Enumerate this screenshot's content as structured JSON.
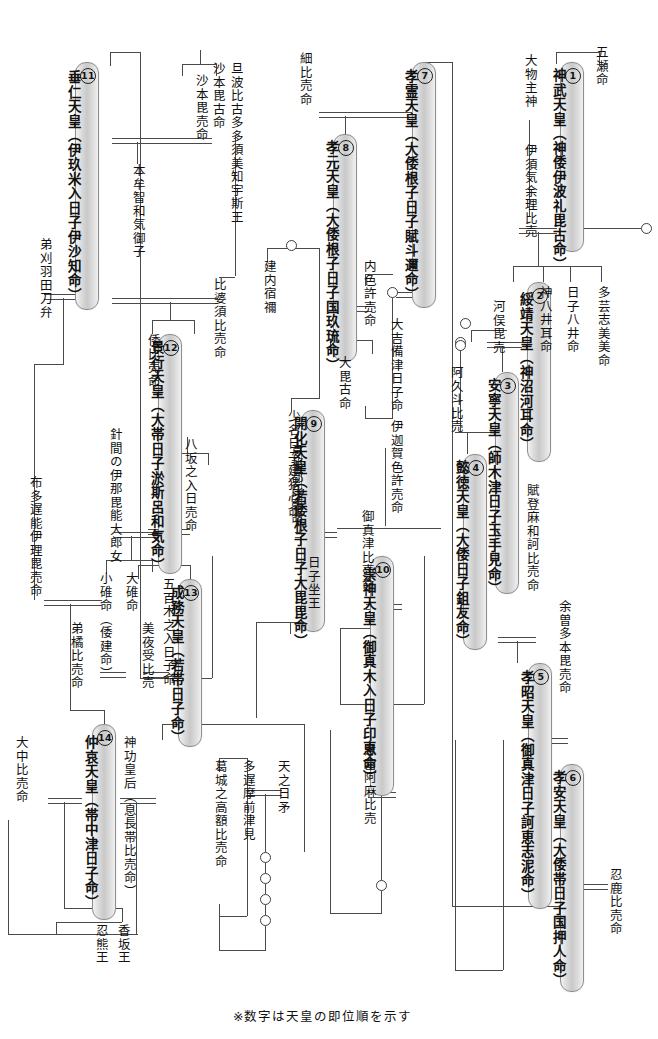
{
  "footnote": "※数字は天皇の即位順を示す",
  "emperors": [
    {
      "num": "①",
      "n": "1",
      "name": "神武天皇（神倭伊波礼毘古命）"
    },
    {
      "num": "②",
      "n": "2",
      "name": "綏靖天皇（神沼河耳命）"
    },
    {
      "num": "③",
      "n": "3",
      "name": "安寧天皇（師木津日子玉手見命）"
    },
    {
      "num": "④",
      "n": "4",
      "name": "懿徳天皇（大倭日子鉏友命）"
    },
    {
      "num": "⑤",
      "n": "5",
      "name": "孝昭天皇（御真津日子訶恵志泥命）"
    },
    {
      "num": "⑥",
      "n": "6",
      "name": "孝安天皇（大倭帯日子国押人命）"
    },
    {
      "num": "⑦",
      "n": "7",
      "name": "孝霊天皇（大倭根子日子賦斗邇命）"
    },
    {
      "num": "⑧",
      "n": "8",
      "name": "孝元天皇（大倭根子日子国玖琉命）"
    },
    {
      "num": "⑨",
      "n": "9",
      "name": "開化天皇（若倭根子日子大毘毘命）"
    },
    {
      "num": "⑩",
      "n": "10",
      "name": "崇神天皇（御真木入日子印恵命）"
    },
    {
      "num": "⑪",
      "n": "11",
      "name": "垂仁天皇（伊玖米入日子伊沙知命）"
    },
    {
      "num": "⑫",
      "n": "12",
      "name": "景行天皇（大帯日子淤斯呂和気命）"
    },
    {
      "num": "⑬",
      "n": "13",
      "name": "成務天皇（若帯日子命）"
    },
    {
      "num": "⑭",
      "n": "14",
      "name": "仲哀天皇（帯中津日子命）"
    }
  ],
  "names": [
    "五瀬命",
    "大物主神",
    "伊須気余理比売",
    "多芸志美美命",
    "日子八井命",
    "神八井耳命",
    "河俣毘売",
    "賦登麻和訶比売命",
    "余曽多本毘売命",
    "忍鹿比売命",
    "細比売命",
    "内色許売命",
    "大吉備津日子命",
    "阿久斗比売",
    "伊迦賀色許売命",
    "大毘古命",
    "建内宿禰",
    "少名日子建猪心命",
    "意祁都比売命",
    "日子坐王",
    "御真津比売命",
    "意富阿麻比売",
    "旦波比古多多須美知宇斯王",
    "沙本毘古命",
    "沙本毘売命",
    "比婆須比売命",
    "本牟智和気御子",
    "倭比売命",
    "弟刈羽田刀弁",
    "布多遅能伊理毘売命",
    "針間の伊那毘能大郎女",
    "八坂之入日売命",
    "五百木之入日子命",
    "大碓命",
    "小碓命（倭建命）",
    "美夜受比売",
    "弟橘比売命",
    "大中比売命",
    "神功皇后（息長帯比売命）",
    "葛城之高額比売命",
    "多遅摩前津見",
    "天之日矛",
    "香坂王",
    "忍熊王"
  ],
  "labels": {
    "itsuse": "五瀬命",
    "omononushi": "大物主神",
    "isukeyori": "伊須気余理比売",
    "tagishimimi": "多芸志美美命",
    "hikoyai": "日子八井命",
    "kamuyaimimi": "神八井耳命",
    "kawamata": "河俣毘売",
    "futomawaka": "賦登麻和訶比売命",
    "yosotahon": "余曽多本毘売命",
    "oshika": "忍鹿比売命",
    "kuwashi": "細比売命",
    "uchishikome": "内色許売命",
    "okibitsu": "大吉備津日子命",
    "akuto": "阿久斗比売",
    "ikagashikome": "伊迦賀色許売命",
    "obiko": "大毘古命",
    "takeuchi": "建内宿禰",
    "sukunana": "少名日子建猪心命",
    "okitsu": "意祁都比売命",
    "hikoimasu": "日子坐王",
    "mimatsu": "御真津比売命",
    "ohoama": "意富阿麻比売",
    "tanba": "旦波比古多多須美知宇斯王",
    "sahobiko": "沙本毘古命",
    "sahobime": "沙本毘売命",
    "hibasu": "比婆須比売命",
    "homuchi": "本牟智和気御子",
    "yamatohime": "倭比売命",
    "otokariha": "弟刈羽田刀弁",
    "futajinoiri": "布多遅能伊理毘売命",
    "harima": "針間の伊那毘能大郎女",
    "yasaka": "八坂之入日売命",
    "ioki": "五百木之入日子命",
    "ousu": "大碓命",
    "ousu2": "小碓命（倭建命）",
    "miyazu": "美夜受比売",
    "ototachibana": "弟橘比売命",
    "onaka": "大中比売命",
    "jingu": "神功皇后（息長帯比売命）",
    "kazuraki": "葛城之高額比売命",
    "tajima": "多遅摩前津見",
    "amenohiboko": "天之日矛",
    "kagosaka": "香坂王",
    "oshikuma": "忍熊王"
  },
  "colors": {
    "line": "#4a4a4a",
    "capsule_border": "#8e8e8e",
    "capsule_fill": "#d4d4d4",
    "text": "#111111",
    "background": "#ffffff"
  },
  "canvas": {
    "width": 658,
    "height": 1039
  }
}
